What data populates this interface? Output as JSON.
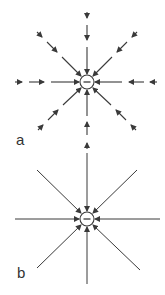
{
  "figure": {
    "panels": [
      {
        "label": "a",
        "charge_symbol": "−",
        "style": "dashed arrows (field strength decreasing with distance)",
        "center": [
          87,
          82
        ],
        "charge_radius": 7
      },
      {
        "label": "b",
        "charge_symbol": "−",
        "style": "continuous field lines with arrowheads at charge",
        "center": [
          87,
          219
        ],
        "charge_radius": 7
      }
    ],
    "colors": {
      "stroke": "#3a3a3a",
      "background": "#ffffff"
    }
  }
}
